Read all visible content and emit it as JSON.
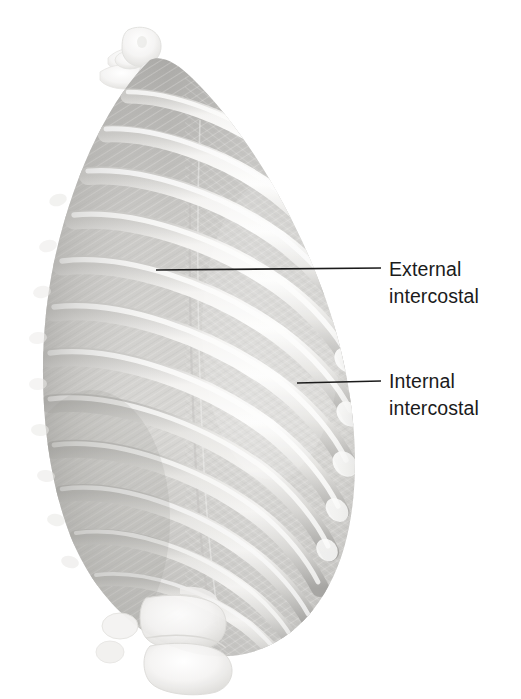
{
  "figure": {
    "name": "intercostal-muscles-illustration",
    "view": "left anterolateral oblique",
    "style": "grayscale pencil/airbrush medical illustration",
    "background_color": "#ffffff"
  },
  "labels": [
    {
      "id": "external-intercostal",
      "line1": "External",
      "line2": "intercostal",
      "text_x": 389,
      "text_y": 256,
      "leader": {
        "x1": 156,
        "y1": 270,
        "x2": 381,
        "y2": 268
      }
    },
    {
      "id": "internal-intercostal",
      "line1": "Internal",
      "line2": "intercostal",
      "text_x": 389,
      "text_y": 368,
      "leader": {
        "x1": 297,
        "y1": 383,
        "x2": 381,
        "y2": 381
      }
    }
  ],
  "colors": {
    "background": "#ffffff",
    "leader_line": "#1b1b1b",
    "label_text": "#1b1b1b",
    "bone_highlight": "#fcfcfb",
    "bone_light": "#f1f0ee",
    "bone_mid": "#d9d8d5",
    "bone_shadow": "#b4b3b0",
    "muscle_light": "#dedddb",
    "muscle_mid": "#c4c3c0",
    "muscle_dark": "#a5a4a1",
    "fiber_stroke": "#b0afac",
    "vertebra_pale": "#f6f5f4",
    "deep_shadow": "#8e8d8a"
  },
  "anatomy": {
    "rib_count": 12,
    "rib_slope_description": "ribs run from upper-left (posterior, near vertebral column) downward and to the right (anterior), curving around the lateral chest wall",
    "intercostal_spaces": 11,
    "structures": [
      {
        "name": "thoracic-vertebrae",
        "location": "top-center",
        "tone": "very pale"
      },
      {
        "name": "ribs",
        "location": "body of figure",
        "tone": "pale highlighted bands"
      },
      {
        "name": "external-intercostal-muscle",
        "location": "posterior/upper intercostal spaces",
        "fiber_direction": "downward and forward"
      },
      {
        "name": "internal-intercostal-muscle",
        "location": "anterior/lateral intercostal spaces",
        "fiber_direction": "downward and backward"
      },
      {
        "name": "costal-cartilage",
        "location": "right anterior rib ends",
        "tone": "bright white rounded tips"
      },
      {
        "name": "lumbar-vertebrae",
        "location": "bottom-center",
        "tone": "very pale"
      },
      {
        "name": "transverse-processes",
        "location": "left posterior margin",
        "tone": "pale nubs"
      }
    ]
  }
}
